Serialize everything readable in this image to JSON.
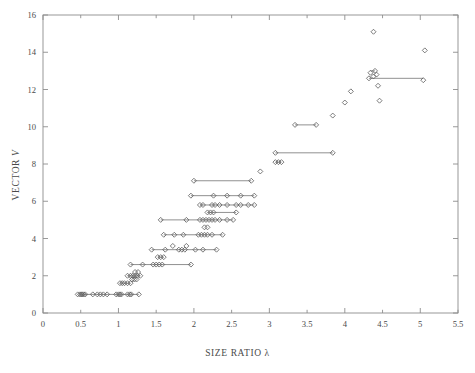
{
  "chart_data": {
    "type": "scatter",
    "title": "",
    "xlabel": "SIZE RATIO  λ",
    "ylabel": "VECTOR V",
    "xlim": [
      0,
      5.5
    ],
    "ylim": [
      0,
      16
    ],
    "xticks": [
      0,
      0.5,
      1,
      1.5,
      2,
      2.5,
      3,
      3.5,
      4,
      4.5,
      5,
      5.5
    ],
    "yticks": [
      0,
      2,
      4,
      6,
      8,
      10,
      12,
      14,
      16
    ],
    "xticklabels": [
      "0",
      "0.5",
      "1",
      "1.5",
      "2",
      "2.5",
      "3",
      "3.5",
      "4",
      "4.5",
      "5",
      "5.5"
    ],
    "yticklabels": [
      "0",
      "2",
      "4",
      "6",
      "8",
      "10",
      "12",
      "14",
      "16"
    ],
    "grid": false,
    "legend": null,
    "marker": "open-diamond",
    "marker_color": "#5a5a5a",
    "line_color": "#6b6b6b",
    "series": [
      {
        "name": "V vs size ratio",
        "points": [
          [
            0.46,
            1.0
          ],
          [
            0.49,
            1.0
          ],
          [
            0.51,
            1.0
          ],
          [
            0.52,
            1.0
          ],
          [
            0.54,
            1.0
          ],
          [
            0.56,
            1.0
          ],
          [
            0.66,
            1.0
          ],
          [
            0.72,
            1.0
          ],
          [
            0.76,
            1.0
          ],
          [
            0.8,
            1.0
          ],
          [
            0.85,
            1.0
          ],
          [
            0.97,
            1.0
          ],
          [
            1.0,
            1.0
          ],
          [
            1.02,
            1.0
          ],
          [
            1.04,
            1.0
          ],
          [
            1.12,
            1.0
          ],
          [
            1.15,
            1.0
          ],
          [
            1.17,
            1.0
          ],
          [
            1.27,
            1.0
          ],
          [
            1.02,
            1.6
          ],
          [
            1.05,
            1.6
          ],
          [
            1.08,
            1.6
          ],
          [
            1.12,
            1.6
          ],
          [
            1.16,
            1.6
          ],
          [
            1.18,
            1.8
          ],
          [
            1.21,
            1.8
          ],
          [
            1.24,
            1.8
          ],
          [
            1.12,
            2.0
          ],
          [
            1.16,
            2.0
          ],
          [
            1.19,
            2.0
          ],
          [
            1.22,
            2.0
          ],
          [
            1.25,
            2.0
          ],
          [
            1.29,
            2.0
          ],
          [
            1.22,
            2.2
          ],
          [
            1.26,
            2.2
          ],
          [
            1.16,
            2.6
          ],
          [
            1.32,
            2.6
          ],
          [
            1.46,
            2.6
          ],
          [
            1.5,
            2.6
          ],
          [
            1.54,
            2.6
          ],
          [
            1.58,
            2.6
          ],
          [
            1.96,
            2.6
          ],
          [
            1.52,
            3.0
          ],
          [
            1.56,
            3.0
          ],
          [
            1.6,
            3.0
          ],
          [
            1.44,
            3.4
          ],
          [
            1.62,
            3.4
          ],
          [
            1.8,
            3.4
          ],
          [
            1.84,
            3.4
          ],
          [
            1.88,
            3.4
          ],
          [
            2.02,
            3.4
          ],
          [
            2.12,
            3.4
          ],
          [
            2.3,
            3.4
          ],
          [
            1.72,
            3.6
          ],
          [
            1.9,
            3.6
          ],
          [
            1.6,
            4.2
          ],
          [
            1.74,
            4.2
          ],
          [
            1.86,
            4.2
          ],
          [
            2.06,
            4.2
          ],
          [
            2.1,
            4.2
          ],
          [
            2.14,
            4.2
          ],
          [
            2.18,
            4.2
          ],
          [
            2.24,
            4.2
          ],
          [
            2.38,
            4.2
          ],
          [
            2.14,
            4.6
          ],
          [
            2.18,
            4.6
          ],
          [
            1.56,
            5.0
          ],
          [
            1.9,
            5.0
          ],
          [
            2.08,
            5.0
          ],
          [
            2.12,
            5.0
          ],
          [
            2.16,
            5.0
          ],
          [
            2.2,
            5.0
          ],
          [
            2.24,
            5.0
          ],
          [
            2.28,
            5.0
          ],
          [
            2.34,
            5.0
          ],
          [
            2.44,
            5.0
          ],
          [
            2.52,
            5.0
          ],
          [
            2.18,
            5.4
          ],
          [
            2.22,
            5.4
          ],
          [
            2.26,
            5.4
          ],
          [
            2.56,
            5.4
          ],
          [
            2.08,
            5.8
          ],
          [
            2.12,
            5.8
          ],
          [
            2.24,
            5.8
          ],
          [
            2.28,
            5.8
          ],
          [
            2.34,
            5.8
          ],
          [
            2.44,
            5.8
          ],
          [
            2.56,
            5.8
          ],
          [
            2.62,
            5.8
          ],
          [
            2.72,
            5.8
          ],
          [
            2.8,
            5.8
          ],
          [
            1.96,
            6.3
          ],
          [
            2.26,
            6.3
          ],
          [
            2.44,
            6.3
          ],
          [
            2.62,
            6.3
          ],
          [
            2.8,
            6.3
          ],
          [
            2.0,
            7.1
          ],
          [
            2.76,
            7.1
          ],
          [
            2.88,
            7.6
          ],
          [
            3.08,
            8.1
          ],
          [
            3.12,
            8.1
          ],
          [
            3.16,
            8.1
          ],
          [
            3.08,
            8.6
          ],
          [
            3.84,
            8.6
          ],
          [
            3.34,
            10.1
          ],
          [
            3.62,
            10.1
          ],
          [
            3.84,
            10.6
          ],
          [
            4.0,
            11.3
          ],
          [
            4.08,
            11.9
          ],
          [
            4.32,
            12.6
          ],
          [
            4.38,
            12.7
          ],
          [
            4.42,
            12.8
          ],
          [
            4.34,
            12.9
          ],
          [
            4.4,
            13.0
          ],
          [
            4.44,
            12.2
          ],
          [
            5.04,
            12.5
          ],
          [
            4.46,
            11.4
          ],
          [
            4.38,
            15.1
          ],
          [
            5.06,
            14.1
          ]
        ],
        "ranges": [
          {
            "y": 1.0,
            "x0": 0.49,
            "x1": 1.27
          },
          {
            "y": 1.6,
            "x0": 1.02,
            "x1": 1.16
          },
          {
            "y": 2.0,
            "x0": 1.12,
            "x1": 1.29
          },
          {
            "y": 2.6,
            "x0": 1.16,
            "x1": 1.96
          },
          {
            "y": 3.0,
            "x0": 1.52,
            "x1": 1.6
          },
          {
            "y": 3.4,
            "x0": 1.44,
            "x1": 2.3
          },
          {
            "y": 4.2,
            "x0": 1.6,
            "x1": 2.38
          },
          {
            "y": 5.0,
            "x0": 1.56,
            "x1": 2.52
          },
          {
            "y": 5.4,
            "x0": 2.18,
            "x1": 2.56
          },
          {
            "y": 5.8,
            "x0": 2.08,
            "x1": 2.8
          },
          {
            "y": 6.3,
            "x0": 1.96,
            "x1": 2.8
          },
          {
            "y": 7.1,
            "x0": 2.0,
            "x1": 2.76
          },
          {
            "y": 8.1,
            "x0": 3.08,
            "x1": 3.16
          },
          {
            "y": 8.6,
            "x0": 3.08,
            "x1": 3.84
          },
          {
            "y": 10.1,
            "x0": 3.34,
            "x1": 3.62
          },
          {
            "y": 12.6,
            "x0": 4.32,
            "x1": 5.04
          },
          {
            "y": 13.0,
            "x0": 4.34,
            "x1": 4.4
          }
        ]
      }
    ]
  },
  "figure": {
    "xlabel": "SIZE RATIO  λ",
    "ylabel_text": "VECTOR ",
    "ylabel_italic": "V"
  }
}
